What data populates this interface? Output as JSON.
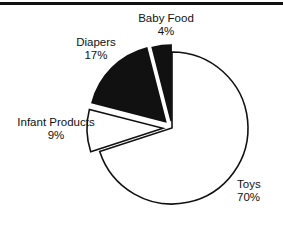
{
  "figure": {
    "background_color": "#ffffff",
    "line_color": "#111111",
    "top_rule": true
  },
  "chart_data": {
    "type": "pie",
    "title": "",
    "xlabel": "",
    "ylabel": "",
    "grid": false,
    "legend": "none",
    "labels_position": "outside",
    "start_angle_deg": 0,
    "direction": "clockwise",
    "center": [
      172,
      128
    ],
    "radius": 76,
    "categories": [
      "Toys",
      "Infant Products",
      "Diapers",
      "Baby Food"
    ],
    "values": [
      70,
      9,
      17,
      4
    ],
    "units": "%",
    "slices": [
      {
        "name": "Toys",
        "value": 70,
        "label": "Toys",
        "percent_label": "70%",
        "fill": "#ffffff",
        "stroke": "#111111",
        "exploded": false,
        "explode_offset": 0
      },
      {
        "name": "Infant Products",
        "value": 9,
        "label": "Infant Products",
        "percent_label": "9%",
        "fill": "#ffffff",
        "stroke": "#111111",
        "exploded": true,
        "explode_offset": 9
      },
      {
        "name": "Diapers",
        "value": 17,
        "label": "Diapers",
        "percent_label": "17%",
        "fill": "#111111",
        "stroke": "#111111",
        "exploded": true,
        "explode_offset": 9
      },
      {
        "name": "Baby Food",
        "value": 4,
        "label": "Baby Food",
        "percent_label": "4%",
        "fill": "#111111",
        "stroke": "#111111",
        "exploded": true,
        "explode_offset": 7
      }
    ]
  }
}
